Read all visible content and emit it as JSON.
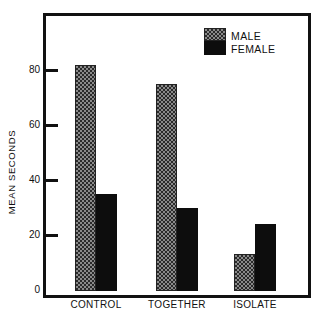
{
  "chart_data": {
    "type": "bar",
    "title": "",
    "xlabel": "",
    "ylabel": "MEAN SECONDS",
    "ylim": [
      0,
      100
    ],
    "yticks": [
      0,
      20,
      40,
      60,
      80
    ],
    "ytick_labels": [
      "0",
      "20",
      "40",
      "60",
      "80"
    ],
    "grid": false,
    "legend_position": "upper right (inside)",
    "categories": [
      "CONTROL",
      "TOGETHER",
      "ISOLATE"
    ],
    "series": [
      {
        "name": "MALE",
        "pattern": "checkered gray",
        "values": [
          82,
          75,
          13
        ]
      },
      {
        "name": "FEMALE",
        "pattern": "solid black",
        "values": [
          35,
          30,
          24
        ]
      }
    ]
  },
  "legend": {
    "male_label": "MALE",
    "female_label": "FEMALE"
  },
  "colors": {
    "male_fill": "#8a8a8a",
    "female_fill": "#0d0d0d",
    "axis": "#111111"
  }
}
